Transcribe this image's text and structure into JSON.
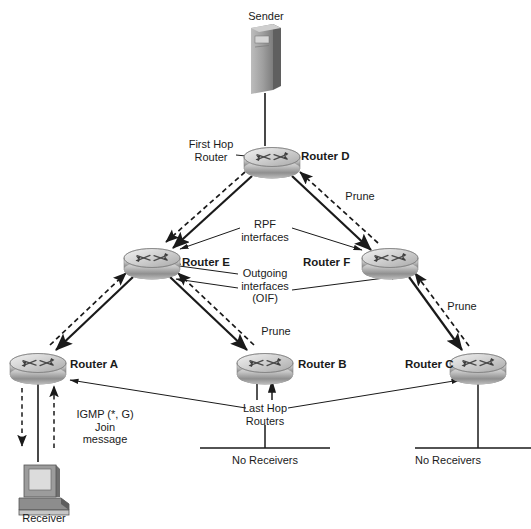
{
  "diagram": {
    "colors": {
      "line": "#1a1a1a",
      "text": "#1a1a1a",
      "device_light": "#d9d9d9",
      "device_mid": "#a8a8a8",
      "device_dark": "#6e6e6e",
      "background": "#ffffff"
    },
    "nodes": [
      {
        "id": "sender",
        "label": "Sender",
        "type": "server",
        "x": 265,
        "y": 62
      },
      {
        "id": "router_d",
        "label": "Router D",
        "type": "router",
        "x": 272,
        "y": 157
      },
      {
        "id": "router_e",
        "label": "Router E",
        "type": "router",
        "x": 152,
        "y": 258
      },
      {
        "id": "router_f",
        "label": "Router F",
        "type": "router",
        "x": 390,
        "y": 258
      },
      {
        "id": "router_a",
        "label": "Router A",
        "type": "router",
        "x": 38,
        "y": 363
      },
      {
        "id": "router_b",
        "label": "Router B",
        "type": "router",
        "x": 265,
        "y": 363
      },
      {
        "id": "router_c",
        "label": "Router C",
        "type": "router",
        "x": 478,
        "y": 363
      },
      {
        "id": "receiver",
        "label": "Receiver",
        "type": "pc",
        "x": 43,
        "y": 487
      }
    ],
    "annotations": [
      {
        "id": "first-hop-router",
        "text": "First Hop\nRouter",
        "x": 211,
        "y": 146
      },
      {
        "id": "prune-d-f",
        "text": "Prune",
        "x": 360,
        "y": 196
      },
      {
        "id": "rpf-interfaces",
        "text": "RPF\ninterfaces",
        "x": 265,
        "y": 226
      },
      {
        "id": "outgoing-interfaces",
        "text": "Outgoing\ninterfaces\n(OIF)",
        "x": 265,
        "y": 281
      },
      {
        "id": "prune-e-b",
        "text": "Prune",
        "x": 276,
        "y": 331
      },
      {
        "id": "prune-f-c",
        "text": "Prune",
        "x": 462,
        "y": 306
      },
      {
        "id": "igmp-join",
        "text": "IGMP (*, G)\nJoin\nmessage",
        "x": 105,
        "y": 425
      },
      {
        "id": "last-hop-routers",
        "text": "Last Hop\nRouters",
        "x": 265,
        "y": 413
      },
      {
        "id": "no-receivers-b",
        "text": "No Receivers",
        "x": 265,
        "y": 461
      },
      {
        "id": "no-receivers-c",
        "text": "No Receivers",
        "x": 448,
        "y": 461
      }
    ],
    "links": [
      {
        "id": "sender-to-router-d",
        "from": "sender",
        "to": "router_d",
        "style": "plain"
      },
      {
        "id": "router-d-to-router-e-traffic",
        "from": "router_d",
        "to": "router_e",
        "style": "solid-arrow"
      },
      {
        "id": "router-d-to-router-e-prune",
        "from": "router_d",
        "to": "router_e",
        "style": "dashed-arrow"
      },
      {
        "id": "router-d-to-router-f-traffic",
        "from": "router_d",
        "to": "router_f",
        "style": "solid-arrow"
      },
      {
        "id": "router-f-to-router-d-prune",
        "from": "router_f",
        "to": "router_d",
        "style": "dashed-arrow"
      },
      {
        "id": "router-e-to-router-a-traffic",
        "from": "router_e",
        "to": "router_a",
        "style": "solid-arrow"
      },
      {
        "id": "router-e-to-router-a-join",
        "from": "router_a",
        "to": "router_e",
        "style": "dashed-arrow"
      },
      {
        "id": "router-e-to-router-b-traffic",
        "from": "router_e",
        "to": "router_b",
        "style": "solid-arrow"
      },
      {
        "id": "router-b-to-router-e-prune",
        "from": "router_b",
        "to": "router_e",
        "style": "dashed-arrow"
      },
      {
        "id": "router-f-to-router-c-traffic",
        "from": "router_f",
        "to": "router_c",
        "style": "solid-arrow"
      },
      {
        "id": "router-c-to-router-f-prune",
        "from": "router_c",
        "to": "router_f",
        "style": "dashed-arrow"
      },
      {
        "id": "router-a-to-receiver-traffic",
        "from": "router_a",
        "to": "receiver",
        "style": "solid-arrow"
      },
      {
        "id": "receiver-to-router-a-join",
        "from": "receiver",
        "to": "router_a",
        "style": "dashed-arrow"
      },
      {
        "id": "router-b-to-segment",
        "from": "router_b",
        "to": "no_receivers_b",
        "style": "plain"
      },
      {
        "id": "router-c-to-segment",
        "from": "router_c",
        "to": "no_receivers_c",
        "style": "plain"
      }
    ]
  }
}
